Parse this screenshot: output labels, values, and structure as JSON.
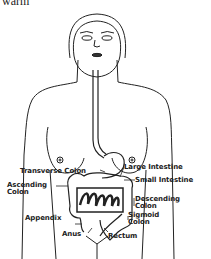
{
  "fragment_text": "warm",
  "labels": {
    "transverse_colon": "Transverse Colon",
    "large_intestine": "Large Intestine",
    "ascending_colon_1": "Ascending",
    "ascending_colon_2": "Colon",
    "small_intestine": "Small Intestine",
    "descending_colon_1": "Descending",
    "descending_colon_2": "Colon",
    "appendix": "Appendix",
    "sigmoid_colon_1": "Sigmoid",
    "sigmoid_colon_2": "Colon",
    "anus": "Anus",
    "rectum": "Rectum"
  }
}
